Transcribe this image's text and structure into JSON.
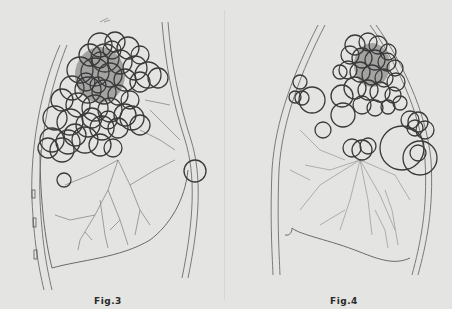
{
  "figures": [
    {
      "id": "fig3",
      "caption": "Fig.3",
      "caption_pos": {
        "x": 94,
        "y": 296
      },
      "circle_color": "#3a3a3a",
      "circles": [
        [
          100,
          45,
          12
        ],
        [
          115,
          42,
          10
        ],
        [
          128,
          48,
          11
        ],
        [
          140,
          55,
          9
        ],
        [
          90,
          55,
          11
        ],
        [
          105,
          58,
          14
        ],
        [
          120,
          62,
          12
        ],
        [
          135,
          68,
          12
        ],
        [
          148,
          75,
          13
        ],
        [
          158,
          78,
          10
        ],
        [
          80,
          70,
          13
        ],
        [
          95,
          72,
          14
        ],
        [
          110,
          75,
          12
        ],
        [
          125,
          80,
          11
        ],
        [
          140,
          82,
          10
        ],
        [
          72,
          88,
          12
        ],
        [
          88,
          90,
          13
        ],
        [
          104,
          92,
          12
        ],
        [
          118,
          95,
          10
        ],
        [
          62,
          100,
          11
        ],
        [
          78,
          105,
          12
        ],
        [
          95,
          108,
          13
        ],
        [
          110,
          110,
          12
        ],
        [
          125,
          115,
          11
        ],
        [
          132,
          118,
          12
        ],
        [
          140,
          125,
          10
        ],
        [
          55,
          118,
          12
        ],
        [
          70,
          122,
          13
        ],
        [
          88,
          125,
          12
        ],
        [
          102,
          128,
          12
        ],
        [
          118,
          128,
          10
        ],
        [
          52,
          140,
          12
        ],
        [
          68,
          142,
          12
        ],
        [
          85,
          140,
          13
        ],
        [
          100,
          145,
          11
        ],
        [
          48,
          148,
          10
        ],
        [
          62,
          150,
          12
        ],
        [
          113,
          148,
          9
        ],
        [
          75,
          135,
          11
        ],
        [
          92,
          118,
          10
        ],
        [
          108,
          120,
          9
        ],
        [
          130,
          100,
          9
        ],
        [
          100,
          60,
          8
        ],
        [
          112,
          50,
          9
        ],
        [
          86,
          82,
          9
        ],
        [
          98,
          85,
          8
        ],
        [
          64,
          180,
          7
        ],
        [
          195,
          171,
          11
        ]
      ],
      "dense_core": {
        "cx": 100,
        "cy": 75,
        "rx": 25,
        "ry": 28
      }
    },
    {
      "id": "fig4",
      "caption": "Fig.4",
      "caption_pos": {
        "x": 330,
        "y": 296
      },
      "circle_color": "#3a3a3a",
      "circles": [
        [
          355,
          45,
          10
        ],
        [
          368,
          42,
          9
        ],
        [
          378,
          45,
          9
        ],
        [
          388,
          52,
          8
        ],
        [
          350,
          55,
          9
        ],
        [
          362,
          58,
          10
        ],
        [
          375,
          60,
          10
        ],
        [
          387,
          62,
          9
        ],
        [
          395,
          68,
          8
        ],
        [
          348,
          70,
          9
        ],
        [
          360,
          72,
          10
        ],
        [
          372,
          75,
          10
        ],
        [
          384,
          78,
          9
        ],
        [
          396,
          82,
          9
        ],
        [
          355,
          88,
          11
        ],
        [
          368,
          90,
          10
        ],
        [
          380,
          92,
          10
        ],
        [
          393,
          95,
          8
        ],
        [
          362,
          105,
          9
        ],
        [
          375,
          108,
          8
        ],
        [
          388,
          107,
          7
        ],
        [
          400,
          103,
          7
        ],
        [
          340,
          72,
          7
        ],
        [
          342,
          96,
          11
        ],
        [
          300,
          82,
          7
        ],
        [
          295,
          97,
          6
        ],
        [
          302,
          98,
          7
        ],
        [
          312,
          100,
          13
        ],
        [
          343,
          115,
          12
        ],
        [
          323,
          130,
          8
        ],
        [
          352,
          148,
          9
        ],
        [
          362,
          150,
          10
        ],
        [
          368,
          146,
          8
        ],
        [
          410,
          120,
          9
        ],
        [
          418,
          122,
          10
        ],
        [
          425,
          130,
          9
        ],
        [
          415,
          128,
          8
        ],
        [
          402,
          148,
          22
        ],
        [
          420,
          158,
          17
        ],
        [
          418,
          153,
          8
        ]
      ],
      "dense_core": {
        "cx": 372,
        "cy": 65,
        "rx": 18,
        "ry": 22
      }
    }
  ]
}
